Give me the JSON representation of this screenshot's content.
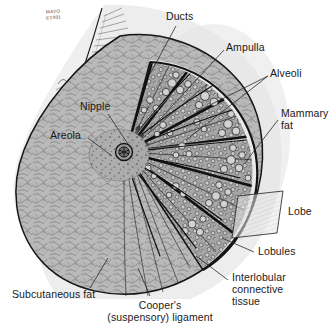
{
  "figure": {
    "credit": {
      "org": "MAYO",
      "copyright": "©1991"
    }
  },
  "labels": {
    "ducts": "Ducts",
    "ampulla": "Ampulla",
    "alveoli": "Alveoli",
    "mammary_fat_line1": "Mammary",
    "mammary_fat_line2": "fat",
    "lobe": "Lobe",
    "lobules": "Lobules",
    "interlobular_line1": "Interlobular",
    "interlobular_line2": "connective",
    "interlobular_line3": "tissue",
    "coopers_line1": "Cooper's",
    "coopers_line2": "(suspensory) ligament",
    "subcutaneous_fat": "Subcutaneous fat",
    "nipple": "Nipple",
    "areola": "Areola"
  },
  "colors": {
    "ink": "#1a1a1a",
    "leader": "#3d3d3d",
    "skin_fill": "#eeeeee",
    "fat_fill": "#b9b9b9",
    "gland_fill": "#9a9a9a",
    "alveoli_fill": "#cfcfcf",
    "areola_fill": "#b0b0b0",
    "nipple_fill": "#555555",
    "background": "#ffffff"
  }
}
